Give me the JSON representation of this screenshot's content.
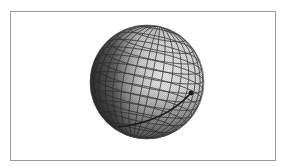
{
  "figure": {
    "frame": {
      "x": 10,
      "y": 11,
      "width": 266,
      "height": 150,
      "border_color": "#9a9a9a"
    },
    "sphere": {
      "center_x": 147,
      "center_y": 82,
      "radius": 57,
      "light_color": "#f2f2f2",
      "mid_color": "#bdbdbd",
      "dark_color": "#3a3a3a",
      "grid_color": "#2a2a2a",
      "latitude_lines": 11,
      "meridian_lines": 12,
      "tilt_deg": 12
    },
    "path": {
      "description": "curved trajectory on sphere surface",
      "start": {
        "x": 118,
        "y": 127
      },
      "control": {
        "x": 165,
        "y": 122
      },
      "end": {
        "x": 191,
        "y": 93
      },
      "color": "#1a1a1a",
      "endpoint_marker": "dot"
    }
  }
}
